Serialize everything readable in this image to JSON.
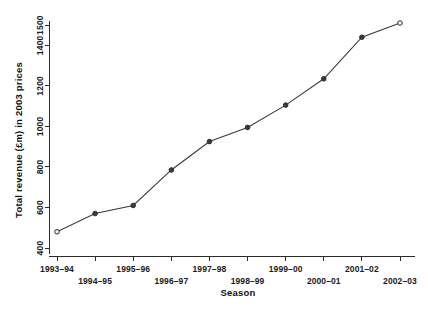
{
  "chart_data": {
    "type": "line",
    "title": "",
    "subtitle": "",
    "xlabel": "Season",
    "ylabel": "Total revenue (£m) in 2003 prices",
    "categories": [
      "1993–94",
      "1994–95",
      "1995–96",
      "1996–97",
      "1997–98",
      "1998–99",
      "1999–00",
      "2000–01",
      "2001–02",
      "2002–03"
    ],
    "values": [
      480,
      570,
      610,
      785,
      925,
      995,
      1105,
      1235,
      1440,
      1510
    ],
    "series": [
      {
        "name": "Total revenue",
        "values": [
          480,
          570,
          610,
          785,
          925,
          995,
          1105,
          1235,
          1440,
          1510
        ]
      }
    ],
    "ylim": [
      400,
      1520
    ],
    "xlim": [
      0,
      9
    ],
    "ytick_labels": [
      "400",
      "600",
      "800",
      "1000",
      "1200",
      "1400",
      "1500"
    ],
    "ytick_values": [
      400,
      600,
      800,
      1000,
      1200,
      1400,
      1500
    ],
    "grid": false,
    "legend": false,
    "legend_position": "none",
    "marker_style": "open-circle",
    "line_color": "#3a3a3a",
    "marker_fill": "#f2f2f2",
    "axis_color": "#2b2b2b",
    "background_color": "#ffffff",
    "xtick_label_rows": [
      0,
      1,
      0,
      1,
      0,
      1,
      0,
      1,
      0,
      1
    ]
  },
  "axes": {
    "y_title": "Total revenue (£m) in 2003 prices",
    "x_title": "Season"
  }
}
